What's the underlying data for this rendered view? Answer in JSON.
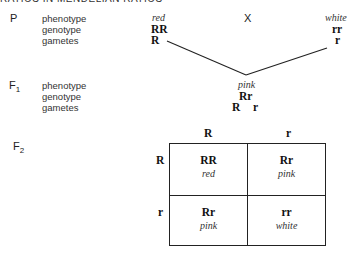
{
  "header": {
    "text": "RATIOS IN MENDELIAN RATIOS"
  },
  "parental": {
    "generation_label": "P",
    "row_labels": [
      "phenotype",
      "genotype",
      "gametes"
    ],
    "parent1": {
      "phenotype": "red",
      "genotype": "RR",
      "gamete": "R"
    },
    "cross_symbol": "X",
    "parent2": {
      "phenotype": "white",
      "genotype": "rr",
      "gamete": "r"
    }
  },
  "f1": {
    "generation_label": "F",
    "generation_sub": "1",
    "row_labels": [
      "phenotype",
      "genotype",
      "gametes"
    ],
    "phenotype": "pink",
    "genotype": "Rr",
    "gametes": [
      "R",
      "r"
    ]
  },
  "f2": {
    "generation_label": "F",
    "generation_sub": "2",
    "column_headers": [
      "R",
      "r"
    ],
    "row_headers": [
      "R",
      "r"
    ],
    "cells": [
      [
        {
          "genotype": "RR",
          "phenotype": "red"
        },
        {
          "genotype": "Rr",
          "phenotype": "pink"
        }
      ],
      [
        {
          "genotype": "Rr",
          "phenotype": "pink"
        },
        {
          "genotype": "rr",
          "phenotype": "white"
        }
      ]
    ]
  },
  "colors": {
    "ink": "#1a1a1a",
    "background": "#ffffff"
  }
}
